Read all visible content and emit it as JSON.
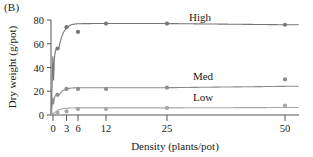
{
  "figure": {
    "panel_label": "(B)",
    "background_color": "#ffffff",
    "text_color": "#1a1a1a"
  },
  "chart_data": {
    "type": "line",
    "title": "",
    "xlabel": "Density (plants/pot)",
    "ylabel": "Dry weight (g/pot)",
    "x_tick_labels": [
      "0",
      "3",
      "6",
      "12",
      "25",
      "50"
    ],
    "x_tick_values": [
      0,
      3,
      6,
      12,
      25,
      50
    ],
    "y_tick_labels": [
      "0",
      "20",
      "40",
      "60",
      "80"
    ],
    "y_tick_values": [
      0,
      20,
      40,
      60,
      80
    ],
    "xlim": [
      0,
      52
    ],
    "ylim": [
      0,
      84
    ],
    "grid": false,
    "legend_position": "inline-right",
    "axis_color": "#555555",
    "series": [
      {
        "name": "High",
        "label": "High",
        "color": "#777777",
        "marker": "circle",
        "x": [
          1,
          3,
          6,
          12,
          25,
          50
        ],
        "values": [
          56,
          74,
          70,
          77,
          77,
          76
        ]
      },
      {
        "name": "Med",
        "label": "Med",
        "color": "#8d8d8d",
        "marker": "circle",
        "x": [
          1,
          3,
          6,
          12,
          25,
          50
        ],
        "values": [
          17,
          22,
          22,
          22,
          23,
          30
        ]
      },
      {
        "name": "Low",
        "label": "Low",
        "color": "#a8a8a8",
        "marker": "circle",
        "x": [
          1,
          3,
          6,
          12,
          25,
          50
        ],
        "values": [
          2,
          3,
          5,
          5,
          6,
          8
        ]
      }
    ],
    "annotations": [
      {
        "text": "High",
        "series": "High"
      },
      {
        "text": "Med",
        "series": "Med"
      },
      {
        "text": "Low",
        "series": "Low"
      }
    ]
  }
}
